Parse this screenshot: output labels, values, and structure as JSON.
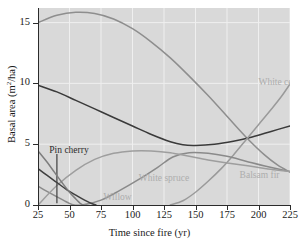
{
  "chart_data": {
    "type": "line",
    "title": "",
    "xlabel": "Time since fire (yr)",
    "ylabel": "Basal area (m2/ha)",
    "ylabel_parts": {
      "pre": "Basal area (m",
      "sup": "2",
      "post": "/ha)"
    },
    "xlim": [
      25,
      225
    ],
    "ylim": [
      0,
      16.2
    ],
    "xticks": [
      25,
      50,
      75,
      100,
      125,
      150,
      175,
      200,
      225
    ],
    "yticks": [
      0,
      5,
      10,
      15
    ],
    "grid": true,
    "grid_color": "#efefef",
    "plot_background": "#d9d9d9",
    "legend": "inline-labels",
    "series": [
      {
        "name": "Trembling aspen",
        "color": "#8e8e8e",
        "label_x": 62,
        "label_y": 60,
        "points": [
          [
            25,
            15.0
          ],
          [
            40,
            15.6
          ],
          [
            55,
            15.85
          ],
          [
            70,
            15.75
          ],
          [
            85,
            15.3
          ],
          [
            100,
            14.5
          ],
          [
            115,
            13.4
          ],
          [
            130,
            12.1
          ],
          [
            145,
            10.6
          ],
          [
            160,
            9.0
          ],
          [
            175,
            7.3
          ],
          [
            190,
            5.6
          ],
          [
            205,
            4.1
          ],
          [
            215,
            3.3
          ],
          [
            225,
            2.7
          ]
        ]
      },
      {
        "name": "Paper birch",
        "color": "#3a3a3a",
        "label_x": 70,
        "label_y": 95,
        "points": [
          [
            25,
            9.85
          ],
          [
            40,
            9.3
          ],
          [
            55,
            8.6
          ],
          [
            70,
            7.9
          ],
          [
            85,
            7.2
          ],
          [
            100,
            6.5
          ],
          [
            115,
            5.8
          ],
          [
            130,
            5.2
          ],
          [
            140,
            4.95
          ],
          [
            150,
            4.9
          ],
          [
            165,
            5.0
          ],
          [
            180,
            5.25
          ],
          [
            195,
            5.6
          ],
          [
            210,
            6.05
          ],
          [
            225,
            6.5
          ]
        ]
      },
      {
        "name": "White cedar",
        "color": "#9a9a9a",
        "label_x": 200,
        "label_y": 10.05,
        "points": [
          [
            130,
            0.0
          ],
          [
            140,
            0.35
          ],
          [
            150,
            1.05
          ],
          [
            160,
            1.95
          ],
          [
            170,
            2.95
          ],
          [
            180,
            4.1
          ],
          [
            190,
            5.35
          ],
          [
            200,
            6.6
          ],
          [
            210,
            7.85
          ],
          [
            218,
            8.9
          ],
          [
            225,
            9.95
          ]
        ]
      },
      {
        "name": "Balsam fir",
        "color": "#8a8a8a",
        "label_x": 185,
        "label_y": 2.35,
        "points": [
          [
            25,
            1.55
          ],
          [
            35,
            0.95
          ],
          [
            45,
            0.4
          ],
          [
            52,
            0.05
          ],
          [
            60,
            0.0
          ],
          [
            75,
            0.4
          ],
          [
            90,
            1.2
          ],
          [
            105,
            2.1
          ],
          [
            120,
            3.1
          ],
          [
            132,
            3.95
          ],
          [
            145,
            4.3
          ],
          [
            160,
            4.25
          ],
          [
            175,
            4.0
          ],
          [
            190,
            3.6
          ],
          [
            205,
            3.2
          ],
          [
            225,
            2.75
          ]
        ]
      },
      {
        "name": "White spruce",
        "color": "#9e9e9e",
        "label_x": 105,
        "label_y": 2.15,
        "points": [
          [
            25,
            0.0
          ],
          [
            40,
            1.6
          ],
          [
            55,
            2.85
          ],
          [
            70,
            3.75
          ],
          [
            85,
            4.25
          ],
          [
            100,
            4.45
          ],
          [
            115,
            4.45
          ],
          [
            130,
            4.3
          ],
          [
            145,
            4.0
          ],
          [
            160,
            3.7
          ],
          [
            175,
            3.45
          ],
          [
            190,
            3.25
          ],
          [
            205,
            3.0
          ],
          [
            225,
            2.75
          ]
        ]
      },
      {
        "name": "Pin cherry",
        "color": "#3f3f3f",
        "label_x": 34,
        "label_y": 4.45,
        "leader": {
          "x": 40,
          "y_top": 4.2,
          "y_bottom": 0.15
        },
        "points": [
          [
            25,
            3.0
          ],
          [
            32,
            2.45
          ],
          [
            40,
            1.85
          ],
          [
            48,
            1.25
          ],
          [
            56,
            0.75
          ],
          [
            62,
            0.4
          ],
          [
            68,
            0.1
          ],
          [
            71,
            0.0
          ]
        ]
      },
      {
        "name": "Willow",
        "color": "#7d7d7d",
        "label_x": 77,
        "label_y": 0.55,
        "points": [
          [
            25,
            4.45
          ],
          [
            32,
            3.55
          ],
          [
            38,
            2.7
          ],
          [
            44,
            1.85
          ],
          [
            50,
            1.05
          ],
          [
            55,
            0.5
          ],
          [
            59,
            0.1
          ],
          [
            61,
            0.0
          ]
        ]
      }
    ]
  }
}
